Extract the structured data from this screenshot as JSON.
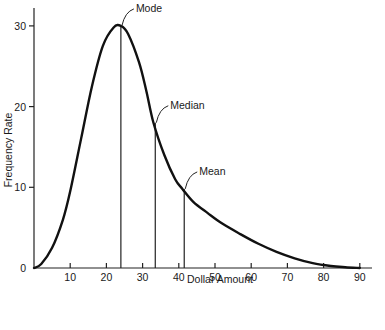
{
  "chart_data": {
    "type": "line",
    "title": "",
    "xlabel": "Dollar Amount",
    "ylabel": "Frequency Rate",
    "xlim": [
      0,
      92
    ],
    "ylim": [
      0,
      32
    ],
    "x_ticks": [
      10,
      20,
      30,
      40,
      50,
      60,
      70,
      80,
      90
    ],
    "y_ticks": [
      0,
      10,
      20,
      30
    ],
    "grid": false,
    "series": [
      {
        "name": "Right-skewed distribution",
        "x": [
          0,
          2,
          5,
          8,
          10,
          13,
          16,
          19,
          22,
          24,
          26,
          29,
          31,
          33,
          36,
          39,
          41,
          44,
          48,
          52,
          57,
          62,
          67,
          72,
          77,
          82,
          86,
          90
        ],
        "values": [
          0,
          0.5,
          2.5,
          6,
          9.5,
          16,
          22.5,
          27.5,
          29.8,
          30,
          29,
          25.5,
          22,
          18,
          14,
          11,
          9.8,
          8.2,
          6.8,
          5.5,
          4.2,
          3.0,
          2.0,
          1.2,
          0.6,
          0.25,
          0.1,
          0
        ]
      }
    ],
    "annotations": [
      {
        "label": "Mode",
        "x": 24,
        "y": 30
      },
      {
        "label": "Median",
        "x": 33.5,
        "y": 18
      },
      {
        "label": "Mean",
        "x": 41.5,
        "y": 9.8
      }
    ]
  }
}
